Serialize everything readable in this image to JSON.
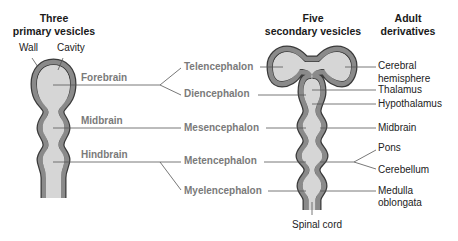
{
  "headers": {
    "primary": [
      "Three",
      "primary vesicles"
    ],
    "secondary": [
      "Five",
      "secondary vesicles"
    ],
    "adult": [
      "Adult",
      "derivatives"
    ]
  },
  "primary_parts": {
    "wall": "Wall",
    "cavity": "Cavity",
    "vesicles": [
      "Forebrain",
      "Midbrain",
      "Hindbrain"
    ]
  },
  "secondary_vesicles": [
    "Telencephalon",
    "Diencephalon",
    "Mesencephalon",
    "Metencephalon",
    "Myelencephalon"
  ],
  "adult_derivatives": {
    "cerebral": [
      "Cerebral",
      "hemisphere"
    ],
    "thalamus": "Thalamus",
    "hypothalamus": "Hypothalamus",
    "midbrain": "Midbrain",
    "pons": "Pons",
    "cerebellum": "Cerebellum",
    "medulla": [
      "Medulla",
      "oblongata"
    ],
    "spinal_cord": "Spinal cord"
  },
  "colors": {
    "wall": "#808080",
    "wall_outline": "#3a3a3a",
    "cavity": "#d6d6d6",
    "leader": "#555555",
    "vesicle_label": "#7a7a7a"
  }
}
